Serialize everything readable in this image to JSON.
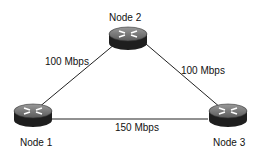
{
  "diagram": {
    "type": "network-topology",
    "nodes": [
      {
        "id": "node1",
        "label": "Node 1",
        "icon": "router-icon"
      },
      {
        "id": "node2",
        "label": "Node 2",
        "icon": "router-icon"
      },
      {
        "id": "node3",
        "label": "Node 3",
        "icon": "router-icon"
      }
    ],
    "links": [
      {
        "from": "node1",
        "to": "node2",
        "label": "100 Mbps"
      },
      {
        "from": "node2",
        "to": "node3",
        "label": "100 Mbps"
      },
      {
        "from": "node1",
        "to": "node3",
        "label": "150 Mbps"
      }
    ]
  }
}
